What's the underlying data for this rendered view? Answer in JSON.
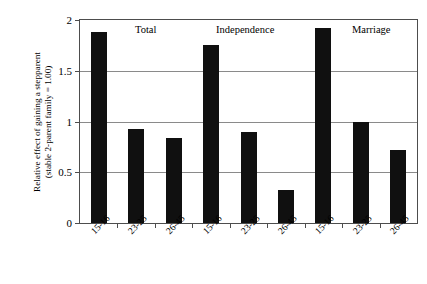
{
  "chart_data": {
    "type": "bar",
    "title": "",
    "xlabel": "",
    "ylabel_line1": "Relative effect of gaining a stepparent",
    "ylabel_line2": "(stable 2-parent family = 1.00)",
    "ylim": [
      0,
      2
    ],
    "yticks": [
      0,
      0.5,
      1,
      1.5,
      2
    ],
    "ytick_labels": [
      "0",
      "0.5",
      "1",
      "1.5",
      "2"
    ],
    "grid": true,
    "legend": "none",
    "bar_color": "#101010",
    "categories": [
      "15-16",
      "23-25",
      "26-45",
      "15-16",
      "23-25",
      "26-45",
      "15-16",
      "23-25",
      "26-45"
    ],
    "values": [
      1.88,
      0.93,
      0.84,
      1.75,
      0.9,
      0.33,
      1.92,
      1.0,
      0.72
    ],
    "groups": [
      {
        "label": "Total",
        "categories": [
          "15-16",
          "23-25",
          "26-45"
        ],
        "values": [
          1.88,
          0.93,
          0.84
        ]
      },
      {
        "label": "Independence",
        "categories": [
          "15-16",
          "23-25",
          "26-45"
        ],
        "values": [
          1.75,
          0.9,
          0.33
        ]
      },
      {
        "label": "Marriage",
        "categories": [
          "15-16",
          "23-25",
          "26-45"
        ],
        "values": [
          1.92,
          1.0,
          0.72
        ]
      }
    ],
    "group_labels": [
      "Total",
      "Independence",
      "Marriage"
    ]
  }
}
